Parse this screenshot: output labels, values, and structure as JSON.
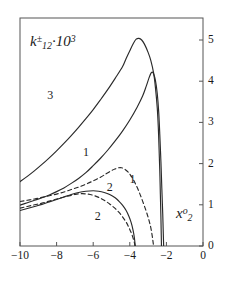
{
  "figure": {
    "background_color": "#ffffff",
    "line_color": "#2a2a2a",
    "axis_color": "#555555"
  },
  "labels": {
    "y_axis_symbol": "k",
    "y_axis_sub": "12",
    "y_axis_sup": "±",
    "y_axis_factor": "·10",
    "y_axis_factor_exp": "3",
    "x_axis_symbol": "x",
    "x_axis_sub": "2",
    "x_axis_sup": "o"
  },
  "chart_data": {
    "type": "line",
    "title": "",
    "xlabel": "x_2^o",
    "ylabel": "k_12^± · 10^3",
    "xlim": [
      -10,
      0
    ],
    "ylim": [
      0,
      5.4
    ],
    "xticks": [
      -10,
      -8,
      -6,
      -4,
      -2,
      0
    ],
    "xtick_labels": [
      "−10",
      "−8",
      "−6",
      "−4",
      "−2",
      "0"
    ],
    "yticks": [
      0,
      1,
      2,
      3,
      4,
      5
    ],
    "ytick_labels": [
      "0",
      "1",
      "2",
      "3",
      "4",
      "5"
    ],
    "y_axis_position": "right",
    "grid": false,
    "legend": "inline-curve-labels",
    "series": [
      {
        "name": "3",
        "label": "3",
        "style": "solid",
        "label_x": -8.35,
        "label_y": 3.66,
        "points": [
          [
            -10.0,
            1.56
          ],
          [
            -9.6,
            1.69
          ],
          [
            -9.2,
            1.83
          ],
          [
            -8.8,
            1.98
          ],
          [
            -8.4,
            2.14
          ],
          [
            -8.0,
            2.31
          ],
          [
            -7.6,
            2.49
          ],
          [
            -7.2,
            2.68
          ],
          [
            -6.8,
            2.88
          ],
          [
            -6.4,
            3.09
          ],
          [
            -6.0,
            3.31
          ],
          [
            -5.6,
            3.55
          ],
          [
            -5.2,
            3.8
          ],
          [
            -4.8,
            4.07
          ],
          [
            -4.4,
            4.35
          ],
          [
            -4.2,
            4.55
          ],
          [
            -4.0,
            4.74
          ],
          [
            -3.8,
            4.92
          ],
          [
            -3.65,
            5.02
          ],
          [
            -3.5,
            5.04
          ],
          [
            -3.35,
            5.0
          ],
          [
            -3.2,
            4.9
          ],
          [
            -3.0,
            4.7
          ],
          [
            -2.85,
            4.5
          ],
          [
            -2.7,
            4.2
          ],
          [
            -2.6,
            3.85
          ],
          [
            -2.5,
            3.35
          ],
          [
            -2.44,
            2.85
          ],
          [
            -2.4,
            2.35
          ],
          [
            -2.36,
            1.8
          ],
          [
            -2.33,
            1.25
          ],
          [
            -2.3,
            0.7
          ],
          [
            -2.28,
            0.25
          ],
          [
            -2.27,
            0.0
          ]
        ]
      },
      {
        "name": "1-solid",
        "label": "1",
        "style": "solid",
        "label_x": -6.4,
        "label_y": 2.28,
        "points": [
          [
            -10.0,
            0.99
          ],
          [
            -9.6,
            1.05
          ],
          [
            -9.2,
            1.11
          ],
          [
            -8.8,
            1.17
          ],
          [
            -8.4,
            1.24
          ],
          [
            -8.0,
            1.32
          ],
          [
            -7.6,
            1.41
          ],
          [
            -7.2,
            1.52
          ],
          [
            -6.8,
            1.64
          ],
          [
            -6.4,
            1.78
          ],
          [
            -6.0,
            1.95
          ],
          [
            -5.6,
            2.13
          ],
          [
            -5.2,
            2.33
          ],
          [
            -4.8,
            2.55
          ],
          [
            -4.4,
            2.79
          ],
          [
            -4.0,
            3.06
          ],
          [
            -3.6,
            3.37
          ],
          [
            -3.3,
            3.64
          ],
          [
            -3.1,
            3.88
          ],
          [
            -2.95,
            4.08
          ],
          [
            -2.85,
            4.19
          ],
          [
            -2.78,
            4.22
          ],
          [
            -2.7,
            4.18
          ],
          [
            -2.6,
            4.02
          ],
          [
            -2.5,
            3.7
          ],
          [
            -2.42,
            3.25
          ],
          [
            -2.36,
            2.7
          ],
          [
            -2.3,
            2.05
          ],
          [
            -2.25,
            1.4
          ],
          [
            -2.2,
            0.78
          ],
          [
            -2.17,
            0.3
          ],
          [
            -2.15,
            0.0
          ]
        ]
      },
      {
        "name": "2-solid",
        "label": "2",
        "style": "solid",
        "label_x": -5.1,
        "label_y": 1.43,
        "points": [
          [
            -10.0,
            0.86
          ],
          [
            -9.6,
            0.91
          ],
          [
            -9.2,
            0.96
          ],
          [
            -8.8,
            1.01
          ],
          [
            -8.4,
            1.07
          ],
          [
            -8.0,
            1.13
          ],
          [
            -7.6,
            1.19
          ],
          [
            -7.2,
            1.25
          ],
          [
            -6.8,
            1.3
          ],
          [
            -6.4,
            1.33
          ],
          [
            -6.0,
            1.34
          ],
          [
            -5.7,
            1.33
          ],
          [
            -5.4,
            1.3
          ],
          [
            -5.1,
            1.25
          ],
          [
            -4.8,
            1.17
          ],
          [
            -4.6,
            1.09
          ],
          [
            -4.4,
            0.99
          ],
          [
            -4.2,
            0.86
          ],
          [
            -4.05,
            0.72
          ],
          [
            -3.92,
            0.56
          ],
          [
            -3.82,
            0.38
          ],
          [
            -3.75,
            0.2
          ],
          [
            -3.7,
            0.0
          ]
        ]
      },
      {
        "name": "1-dashed",
        "label": "1",
        "style": "dashed",
        "label_x": -3.85,
        "label_y": 1.62,
        "points": [
          [
            -10.0,
            1.08
          ],
          [
            -9.6,
            1.11
          ],
          [
            -9.2,
            1.14
          ],
          [
            -8.8,
            1.18
          ],
          [
            -8.4,
            1.22
          ],
          [
            -8.0,
            1.26
          ],
          [
            -7.6,
            1.31
          ],
          [
            -7.2,
            1.37
          ],
          [
            -6.8,
            1.43
          ],
          [
            -6.4,
            1.5
          ],
          [
            -6.0,
            1.58
          ],
          [
            -5.6,
            1.67
          ],
          [
            -5.3,
            1.75
          ],
          [
            -5.0,
            1.83
          ],
          [
            -4.8,
            1.87
          ],
          [
            -4.6,
            1.9
          ],
          [
            -4.45,
            1.9
          ],
          [
            -4.3,
            1.87
          ],
          [
            -4.1,
            1.8
          ],
          [
            -3.9,
            1.68
          ],
          [
            -3.7,
            1.52
          ],
          [
            -3.5,
            1.32
          ],
          [
            -3.3,
            1.09
          ],
          [
            -3.1,
            0.84
          ],
          [
            -2.95,
            0.62
          ],
          [
            -2.85,
            0.44
          ],
          [
            -2.78,
            0.26
          ],
          [
            -2.73,
            0.1
          ],
          [
            -2.7,
            0.0
          ]
        ]
      },
      {
        "name": "2-dashed",
        "label": "2",
        "style": "dashed",
        "label_x": -5.75,
        "label_y": 0.73,
        "points": [
          [
            -10.0,
            0.92
          ],
          [
            -9.6,
            0.96
          ],
          [
            -9.2,
            1.0
          ],
          [
            -8.8,
            1.04
          ],
          [
            -8.4,
            1.09
          ],
          [
            -8.0,
            1.14
          ],
          [
            -7.6,
            1.19
          ],
          [
            -7.2,
            1.23
          ],
          [
            -6.9,
            1.26
          ],
          [
            -6.6,
            1.27
          ],
          [
            -6.3,
            1.26
          ],
          [
            -6.0,
            1.23
          ],
          [
            -5.7,
            1.18
          ],
          [
            -5.4,
            1.11
          ],
          [
            -5.1,
            1.02
          ],
          [
            -4.85,
            0.93
          ],
          [
            -4.6,
            0.82
          ],
          [
            -4.4,
            0.71
          ],
          [
            -4.2,
            0.58
          ],
          [
            -4.05,
            0.45
          ],
          [
            -3.92,
            0.32
          ],
          [
            -3.82,
            0.19
          ],
          [
            -3.75,
            0.08
          ],
          [
            -3.72,
            0.0
          ]
        ]
      }
    ]
  }
}
